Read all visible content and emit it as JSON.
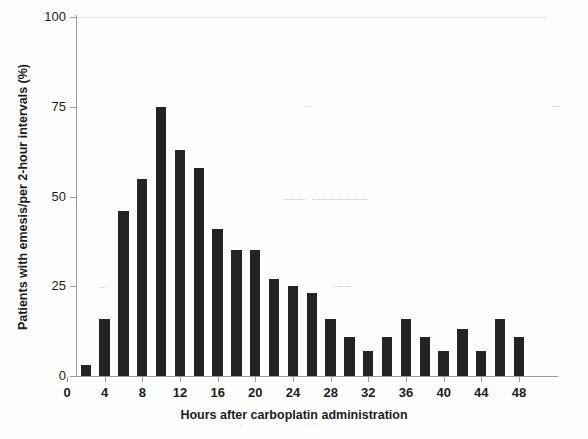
{
  "chart_data": {
    "type": "bar",
    "title": "",
    "subtitle": "",
    "xlabel": "Hours after carboplatin administration",
    "ylabel": "Patients with emesis/per 2-hour intervals (%)",
    "xlim": [
      0,
      48
    ],
    "ylim": [
      0,
      100
    ],
    "grid": false,
    "legend": null,
    "annotations": [],
    "xticks": [
      0,
      4,
      8,
      12,
      16,
      20,
      24,
      28,
      32,
      36,
      40,
      44,
      48
    ],
    "xtick_labels": [
      "0",
      "4",
      "8",
      "12",
      "16",
      "20",
      "24",
      "28",
      "32",
      "36",
      "40",
      "44",
      "48"
    ],
    "yticks": [
      0,
      25,
      50,
      75,
      100
    ],
    "ytick_labels": [
      "0",
      "25",
      "50",
      "75",
      "100"
    ],
    "bar_width_hours": 1.1,
    "bar_color": "#242424",
    "x": [
      2,
      4,
      6,
      8,
      10,
      12,
      14,
      16,
      18,
      20,
      22,
      24,
      26,
      28,
      30,
      32,
      34,
      36,
      38,
      40,
      42,
      44,
      46,
      48
    ],
    "categories": [
      "2",
      "4",
      "6",
      "8",
      "10",
      "12",
      "14",
      "16",
      "18",
      "20",
      "22",
      "24",
      "26",
      "28",
      "30",
      "32",
      "34",
      "36",
      "38",
      "40",
      "42",
      "44",
      "46",
      "48"
    ],
    "values": [
      3,
      16,
      46,
      55,
      75,
      63,
      58,
      41,
      35,
      35,
      27,
      25,
      23,
      16,
      11,
      7,
      11,
      16,
      11,
      7,
      13,
      7,
      16,
      11
    ]
  },
  "axes": {
    "y_title": "Patients with emesis/per 2-hour intervals (%)",
    "x_title": "Hours after carboplatin administration"
  }
}
